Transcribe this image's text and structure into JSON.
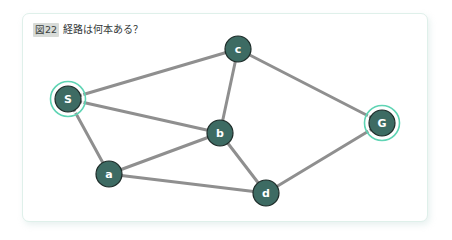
{
  "card": {
    "figure_badge": "図22",
    "caption": "経路は何本ある？",
    "border_color": "#dff0ea",
    "background_color": "#ffffff"
  },
  "graph": {
    "type": "undirected-graph",
    "node_fill_color": "#3d6b63",
    "node_stroke_color": "#1d2b28",
    "node_label_color": "#ffffff",
    "edge_color": "#8f8f8f",
    "highlight_ring_color": "#5fd4b4",
    "nodes": [
      {
        "id": "S",
        "label": "S",
        "x": 45,
        "y": 85,
        "r": 13,
        "highlighted": true
      },
      {
        "id": "c",
        "label": "c",
        "x": 215,
        "y": 35,
        "r": 13,
        "highlighted": false
      },
      {
        "id": "b",
        "label": "b",
        "x": 197,
        "y": 119,
        "r": 13,
        "highlighted": false
      },
      {
        "id": "G",
        "label": "G",
        "x": 359,
        "y": 109,
        "r": 13,
        "highlighted": true
      },
      {
        "id": "a",
        "label": "a",
        "x": 86,
        "y": 160,
        "r": 13,
        "highlighted": false
      },
      {
        "id": "d",
        "label": "d",
        "x": 243,
        "y": 179,
        "r": 13,
        "highlighted": false
      }
    ],
    "edges": [
      {
        "from": "S",
        "to": "c"
      },
      {
        "from": "S",
        "to": "b"
      },
      {
        "from": "S",
        "to": "a"
      },
      {
        "from": "c",
        "to": "b"
      },
      {
        "from": "c",
        "to": "G"
      },
      {
        "from": "a",
        "to": "b"
      },
      {
        "from": "a",
        "to": "d"
      },
      {
        "from": "b",
        "to": "d"
      },
      {
        "from": "d",
        "to": "G"
      }
    ]
  }
}
